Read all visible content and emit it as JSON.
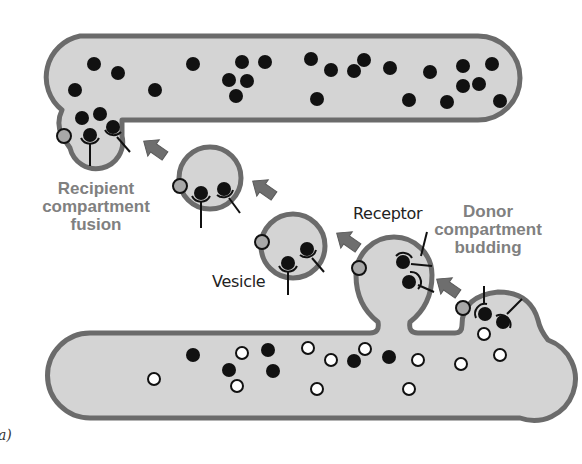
{
  "figure": {
    "panel_label": "a)",
    "colors": {
      "membrane": "#6b6b6b",
      "lumen": "#d4d4d4",
      "cargo_dark": "#111111",
      "cargo_light": "#ffffff",
      "coat_marker": "#a8a8a8",
      "arrow": "#6e6e6e",
      "bold_label": "#808080",
      "plain_label": "#222222"
    }
  },
  "labels": {
    "recipient_line1": "Recipient",
    "recipient_line2": "compartment",
    "recipient_line3": "fusion",
    "donor_line1": "Donor",
    "donor_line2": "compartment",
    "donor_line3": "budding",
    "receptor": "Receptor",
    "vesicle": "Vesicle"
  },
  "diagram": {
    "compartments": [
      {
        "name": "recipient-compartment",
        "position": "top",
        "cargo": "dark only"
      },
      {
        "name": "donor-compartment",
        "position": "bottom",
        "cargo": "dark and light"
      }
    ],
    "vesicles": 2,
    "budding_vesicle": 1,
    "arrows": 4,
    "flow": "donor compartment budding → vesicle → recipient compartment fusion"
  }
}
